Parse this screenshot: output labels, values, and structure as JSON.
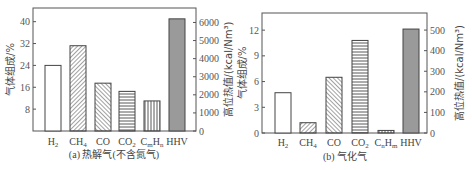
{
  "chart_data": [
    {
      "type": "bar",
      "title": "(a) 热解气(不含氮气)",
      "categories": [
        "H2",
        "CH4",
        "CO",
        "CO2",
        "CmHn",
        "HHV"
      ],
      "category_labels": [
        {
          "base": "H",
          "sub": "2"
        },
        {
          "base": "CH",
          "sub": "4"
        },
        {
          "base": "CO",
          "sub": ""
        },
        {
          "base": "CO",
          "sub": "2"
        },
        {
          "base": "C",
          "sub": "m",
          "base2": "H",
          "sub2": "n"
        },
        {
          "base": "HHV",
          "sub": ""
        }
      ],
      "series": [
        {
          "name": "气体组成/%",
          "axis": "left",
          "categories": [
            "H2",
            "CH4",
            "CO",
            "CO2",
            "CmHn"
          ],
          "values": [
            24,
            31.2,
            17.5,
            14.5,
            11
          ]
        },
        {
          "name": "高位热值/(kcal/Nm3)",
          "axis": "right",
          "categories": [
            "HHV"
          ],
          "values": [
            6200
          ]
        }
      ],
      "ylabel": "气体组成/%",
      "ylabel_right": "高位热值/(kcal/Nm³)",
      "ylim": [
        0,
        45
      ],
      "ylim_right": [
        0,
        6800
      ],
      "yticks": [
        8,
        16,
        24,
        32,
        40
      ],
      "yticks_right": [
        0,
        1000,
        2000,
        3000,
        4000,
        5000,
        6000
      ],
      "patterns": [
        "none",
        "diag-right",
        "diag-left",
        "horizontal",
        "vertical",
        "gray-fill"
      ]
    },
    {
      "type": "bar",
      "title": "(b) 气化气",
      "categories": [
        "H2",
        "CH4",
        "CO",
        "CO2",
        "CmHn",
        "HHV"
      ],
      "category_labels": [
        {
          "base": "H",
          "sub": "2"
        },
        {
          "base": "CH",
          "sub": "4"
        },
        {
          "base": "CO",
          "sub": ""
        },
        {
          "base": "CO",
          "sub": "2"
        },
        {
          "base": "C",
          "sub": "n",
          "base2": "H",
          "sub2": "m"
        },
        {
          "base": "HHV",
          "sub": ""
        }
      ],
      "series": [
        {
          "name": "气体组成/%",
          "axis": "left",
          "categories": [
            "H2",
            "CH4",
            "CO",
            "CO2",
            "CmHn"
          ],
          "values": [
            4.7,
            1.2,
            6.5,
            10.8,
            0.3
          ]
        },
        {
          "name": "高位热值/(kcal/Nm3)",
          "axis": "right",
          "categories": [
            "HHV"
          ],
          "values": [
            505
          ]
        }
      ],
      "ylabel": "气体组成/%",
      "ylabel_right": "高位热值/(kcal/Nm³)",
      "ylim": [
        0,
        14
      ],
      "ylim_right": [
        0,
        583
      ],
      "yticks": [
        0,
        3,
        6,
        9,
        12
      ],
      "yticks_right": [
        0,
        100,
        200,
        300,
        400,
        500
      ],
      "patterns": [
        "none",
        "diag-right",
        "diag-left",
        "horizontal",
        "vertical",
        "gray-fill"
      ]
    }
  ],
  "labels": {
    "a_caption": "(a) 热解气(不含氮气)",
    "b_caption": "(b) 气化气",
    "left_axis": "气体组成/%",
    "right_axis": "高位热值/(kcal/Nm³)"
  },
  "colors": {
    "frame": "#555555",
    "bar_stroke": "#444444",
    "hhv_fill": "#9a9a9a",
    "text": "#444444"
  }
}
